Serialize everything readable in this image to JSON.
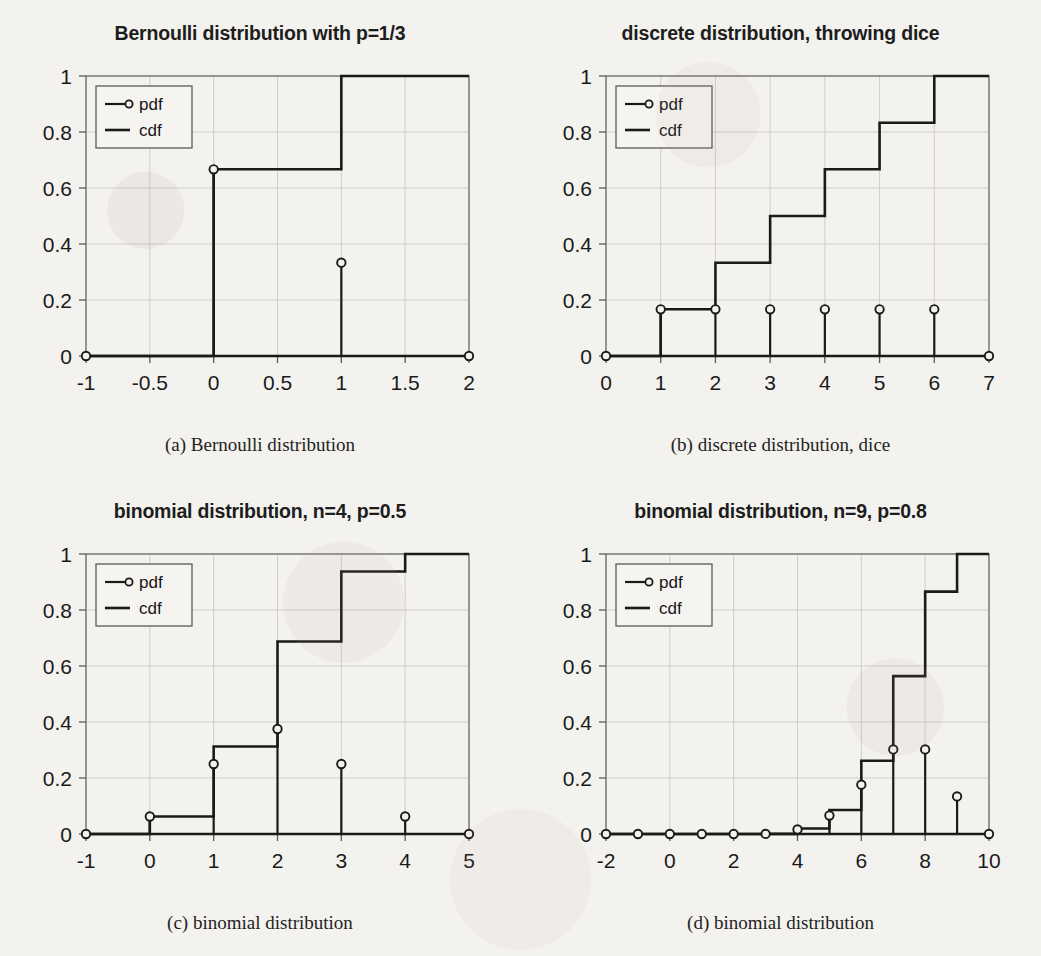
{
  "page": {
    "background": "#f4f2ee",
    "ink": "#1a1a1a",
    "grid_color": "#cfcdc8"
  },
  "legend": {
    "pdf_label": "pdf",
    "cdf_label": "cdf"
  },
  "panels": [
    {
      "id": "a",
      "title": "Bernoulli distribution with p=1/3",
      "caption": "(a)  Bernoulli distribution"
    },
    {
      "id": "b",
      "title": "discrete distribution, throwing dice",
      "caption": "(b)  discrete distribution, dice"
    },
    {
      "id": "c",
      "title": "binomial distribution, n=4, p=0.5",
      "caption": "(c)  binomial distribution"
    },
    {
      "id": "d",
      "title": "binomial distribution, n=9, p=0.8",
      "caption": "(d)  binomial distribution"
    }
  ],
  "chart_data": [
    {
      "type": "line",
      "id": "a",
      "title": "Bernoulli distribution with p=1/3",
      "xlabel": "",
      "ylabel": "",
      "xlim": [
        -1,
        2
      ],
      "ylim": [
        0,
        1
      ],
      "xticks": [
        -1,
        -0.5,
        0,
        0.5,
        1,
        1.5,
        2
      ],
      "xticklabels": [
        "-1",
        "-0.5",
        "0",
        "0.5",
        "1",
        "1.5",
        "2"
      ],
      "yticks": [
        0,
        0.2,
        0.4,
        0.6,
        0.8,
        1
      ],
      "yticklabels": [
        "0",
        "0.2",
        "0.4",
        "0.6",
        "0.8",
        "1"
      ],
      "grid": true,
      "legend": [
        "pdf",
        "cdf"
      ],
      "legend_position": "upper left",
      "series": [
        {
          "name": "pdf",
          "style": "stem",
          "x": [
            -1,
            0,
            1,
            2
          ],
          "values": [
            0,
            0.6667,
            0.3333,
            0
          ]
        },
        {
          "name": "cdf",
          "style": "step",
          "x": [
            -1,
            0,
            1,
            2
          ],
          "values": [
            0,
            0.6667,
            1,
            1
          ]
        }
      ]
    },
    {
      "type": "line",
      "id": "b",
      "title": "discrete distribution, throwing dice",
      "xlabel": "",
      "ylabel": "",
      "xlim": [
        0,
        7
      ],
      "ylim": [
        0,
        1
      ],
      "xticks": [
        0,
        1,
        2,
        3,
        4,
        5,
        6,
        7
      ],
      "xticklabels": [
        "0",
        "1",
        "2",
        "3",
        "4",
        "5",
        "6",
        "7"
      ],
      "yticks": [
        0,
        0.2,
        0.4,
        0.6,
        0.8,
        1
      ],
      "yticklabels": [
        "0",
        "0.2",
        "0.4",
        "0.6",
        "0.8",
        "1"
      ],
      "grid": true,
      "legend": [
        "pdf",
        "cdf"
      ],
      "legend_position": "upper left",
      "series": [
        {
          "name": "pdf",
          "style": "stem",
          "x": [
            0,
            1,
            2,
            3,
            4,
            5,
            6,
            7
          ],
          "values": [
            0,
            0.1667,
            0.1667,
            0.1667,
            0.1667,
            0.1667,
            0.1667,
            0
          ]
        },
        {
          "name": "cdf",
          "style": "step",
          "x": [
            0,
            1,
            2,
            3,
            4,
            5,
            6,
            7
          ],
          "values": [
            0,
            0.1667,
            0.3333,
            0.5,
            0.6667,
            0.8333,
            1,
            1
          ]
        }
      ]
    },
    {
      "type": "line",
      "id": "c",
      "title": "binomial distribution, n=4, p=0.5",
      "xlabel": "",
      "ylabel": "",
      "xlim": [
        -1,
        5
      ],
      "ylim": [
        0,
        1
      ],
      "xticks": [
        -1,
        0,
        1,
        2,
        3,
        4,
        5
      ],
      "xticklabels": [
        "-1",
        "0",
        "1",
        "2",
        "3",
        "4",
        "5"
      ],
      "yticks": [
        0,
        0.2,
        0.4,
        0.6,
        0.8,
        1
      ],
      "yticklabels": [
        "0",
        "0.2",
        "0.4",
        "0.6",
        "0.8",
        "1"
      ],
      "grid": true,
      "legend": [
        "pdf",
        "cdf"
      ],
      "legend_position": "upper left",
      "series": [
        {
          "name": "pdf",
          "style": "stem",
          "x": [
            -1,
            0,
            1,
            2,
            3,
            4,
            5
          ],
          "values": [
            0,
            0.0625,
            0.25,
            0.375,
            0.25,
            0.0625,
            0
          ]
        },
        {
          "name": "cdf",
          "style": "step",
          "x": [
            -1,
            0,
            1,
            2,
            3,
            4,
            5
          ],
          "values": [
            0,
            0.0625,
            0.3125,
            0.6875,
            0.9375,
            1,
            1
          ]
        }
      ]
    },
    {
      "type": "line",
      "id": "d",
      "title": "binomial distribution, n=9, p=0.8",
      "xlabel": "",
      "ylabel": "",
      "xlim": [
        -2,
        10
      ],
      "ylim": [
        0,
        1
      ],
      "xticks": [
        -2,
        0,
        2,
        4,
        6,
        8,
        10
      ],
      "xticklabels": [
        "-2",
        "0",
        "2",
        "4",
        "6",
        "8",
        "10"
      ],
      "yticks": [
        0,
        0.2,
        0.4,
        0.6,
        0.8,
        1
      ],
      "yticklabels": [
        "0",
        "0.2",
        "0.4",
        "0.6",
        "0.8",
        "1"
      ],
      "grid": true,
      "legend": [
        "pdf",
        "cdf"
      ],
      "legend_position": "upper left",
      "series": [
        {
          "name": "pdf",
          "style": "stem",
          "x": [
            -2,
            -1,
            0,
            1,
            2,
            3,
            4,
            5,
            6,
            7,
            8,
            9,
            10
          ],
          "values": [
            0,
            0,
            0,
            0,
            0,
            0.0003,
            0.0165,
            0.0661,
            0.1762,
            0.302,
            0.302,
            0.1342,
            0
          ]
        },
        {
          "name": "cdf",
          "style": "step",
          "x": [
            -2,
            -1,
            0,
            1,
            2,
            3,
            4,
            5,
            6,
            7,
            8,
            9,
            10
          ],
          "values": [
            0,
            0,
            0,
            0,
            0,
            0.0003,
            0.0196,
            0.0856,
            0.2618,
            0.5638,
            0.8658,
            1,
            1
          ]
        }
      ]
    }
  ]
}
